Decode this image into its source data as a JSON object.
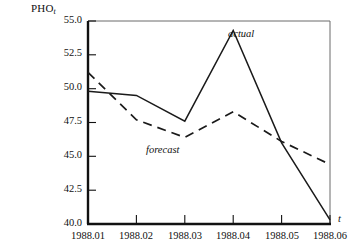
{
  "chart_data": {
    "type": "line",
    "title": "",
    "subtitle": "",
    "ylabel": "PHO",
    "ylabel_subscript": "t",
    "xlabel": "t",
    "x": [
      "1988.01",
      "1988.02",
      "1988.03",
      "1988.04",
      "1988.05",
      "1988.06"
    ],
    "xtick_labels": [
      "1988.01",
      "1988.02",
      "1988.03",
      "1988.04",
      "1988.05",
      "1988.06"
    ],
    "ytick_labels": [
      "55.0",
      "52.5",
      "50.0",
      "47.5",
      "45.0",
      "42.5",
      "40.0"
    ],
    "ytick_values": [
      55.0,
      52.5,
      50.0,
      47.5,
      45.0,
      42.5,
      40.0
    ],
    "ylim": [
      40.0,
      55.0
    ],
    "grid": false,
    "legend_position": "inline-annotation",
    "series": [
      {
        "name": "actual",
        "style": "solid",
        "color": "#1a1a1a",
        "values": [
          49.8,
          49.5,
          47.6,
          54.3,
          46.0,
          40.3
        ]
      },
      {
        "name": "forecast",
        "style": "dashed",
        "color": "#1a1a1a",
        "values": [
          51.2,
          47.7,
          46.4,
          48.3,
          46.1,
          44.4
        ]
      }
    ],
    "annotations": [
      {
        "text": "actual",
        "x": "1988.04",
        "y": 53.1
      },
      {
        "text": "forecast",
        "x": "1988.03",
        "y": 44.6
      }
    ]
  },
  "axes": {
    "y_axis_label_main": "PHO",
    "y_axis_label_sub": "t",
    "x_axis_var": "t",
    "ytick_0": "55.0",
    "ytick_1": "52.5",
    "ytick_2": "50.0",
    "ytick_3": "47.5",
    "ytick_4": "45.0",
    "ytick_5": "42.5",
    "ytick_6": "40.0",
    "xtick_0": "1988.01",
    "xtick_1": "1988.02",
    "xtick_2": "1988.03",
    "xtick_3": "1988.04",
    "xtick_4": "1988.05",
    "xtick_5": "1988.06"
  },
  "annotations": {
    "actual_label": "actual",
    "forecast_label": "forecast"
  },
  "colors": {
    "line": "#1a1a1a",
    "axis": "#111111",
    "background": "#ffffff"
  }
}
